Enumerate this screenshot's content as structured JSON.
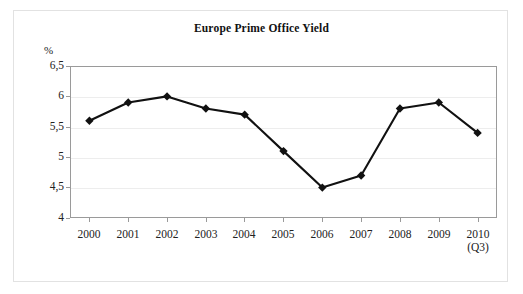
{
  "chart_data": {
    "type": "line",
    "title": "Europe Prime Office Yield",
    "xlabel": "",
    "ylabel": "%",
    "categories": [
      "2000",
      "2001",
      "2002",
      "2003",
      "2004",
      "2005",
      "2006",
      "2007",
      "2008",
      "2009",
      "2010"
    ],
    "category_sublabels": [
      "",
      "",
      "",
      "",
      "",
      "",
      "",
      "",
      "",
      "",
      "(Q3)"
    ],
    "values": [
      5.6,
      5.9,
      6.0,
      5.8,
      5.7,
      5.1,
      4.5,
      4.7,
      5.8,
      5.9,
      5.4
    ],
    "series": [
      {
        "name": "Europe Prime Office Yield",
        "values": [
          5.6,
          5.9,
          6.0,
          5.8,
          5.7,
          5.1,
          4.5,
          4.7,
          5.8,
          5.9,
          5.4
        ]
      }
    ],
    "ylim": [
      4,
      6.5
    ],
    "ytick_labels": [
      "6,5",
      "6",
      "5,5",
      "5",
      "4,5",
      "4"
    ],
    "ytick_values": [
      6.5,
      6.0,
      5.5,
      5.0,
      4.5,
      4.0
    ],
    "grid": true,
    "legend": "none",
    "marker": "diamond",
    "line_color": "#111111",
    "marker_color": "#111111",
    "grid_color": "#ededed",
    "axis_color": "#9a9a9a"
  }
}
